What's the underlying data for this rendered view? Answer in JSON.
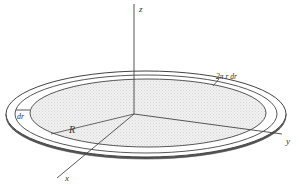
{
  "figure": {
    "type": "3D disc with annular ring element",
    "colors": {
      "line": "#444444",
      "disc_fill": "#ececec",
      "background": "#ffffff"
    },
    "labels": {
      "z_axis": "z",
      "y_axis": "y",
      "x_axis": "x",
      "radius": "R",
      "ring_width": "dr",
      "ring_area": "2π r dr"
    }
  }
}
